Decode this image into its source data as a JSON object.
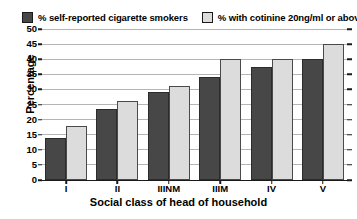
{
  "chart_data": {
    "type": "bar",
    "title": "",
    "subtitle": "",
    "xlabel": "Social class of head of household",
    "ylabel": "Percentage",
    "categories": [
      "I",
      "II",
      "IIINM",
      "IIIM",
      "IV",
      "V"
    ],
    "series": [
      {
        "name": "% self-reported cigarette smokers",
        "color": "#474747",
        "values": [
          14,
          23.5,
          29,
          34,
          37.5,
          40
        ]
      },
      {
        "name": "% with cotinine 20ng/ml or above",
        "color": "#dcdcdc",
        "values": [
          18,
          26,
          31,
          40,
          40,
          45
        ]
      }
    ],
    "ylim": [
      0,
      50
    ],
    "ytick_step": 5,
    "yticks": [
      0,
      5,
      10,
      15,
      20,
      25,
      30,
      35,
      40,
      45,
      50
    ],
    "ytick_labels": [
      "0",
      "5",
      "10",
      "15",
      "20",
      "25",
      "30",
      "35",
      "40",
      "45",
      "50"
    ],
    "grid": true,
    "grid_axis": "y",
    "grid_color": "#b5b5b5",
    "legend_position": "top",
    "axis_color": "#1a1a1a",
    "background": "#ffffff"
  },
  "legend": {
    "entries": [
      {
        "label": "% self-reported cigarette smokers",
        "swatch": "dark"
      },
      {
        "label": "% with cotinine 20ng/ml or above",
        "swatch": "light"
      }
    ]
  }
}
